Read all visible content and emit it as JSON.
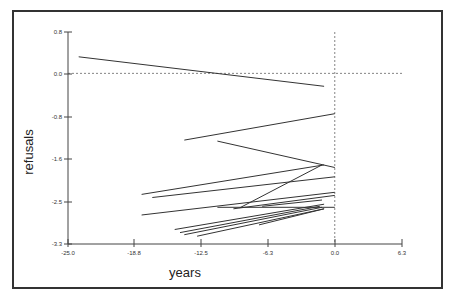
{
  "chart_data": {
    "type": "line",
    "title": "",
    "xlabel": "years",
    "ylabel": "refusals",
    "xlim": [
      -25.0,
      6.3
    ],
    "ylim": [
      -3.3,
      0.8
    ],
    "x_ticks": [
      "-25.0",
      "-18.8",
      "-12.5",
      "-6.3",
      "0.0",
      "6.3"
    ],
    "y_ticks": [
      "0.8",
      "0.0",
      "-0.8",
      "-1.6",
      "-2.5",
      "-3.3"
    ],
    "grid": false,
    "legend": null,
    "reference_lines": [
      {
        "orientation": "horizontal",
        "value": 0.0,
        "style": "dotted"
      },
      {
        "orientation": "vertical",
        "value": 0.0,
        "style": "dotted"
      }
    ],
    "series": [
      {
        "name": "case-1",
        "x": [
          -24.0,
          -1.0
        ],
        "y": [
          0.32,
          -0.25
        ]
      },
      {
        "name": "case-2",
        "x": [
          -14.1,
          0.0
        ],
        "y": [
          -1.29,
          -0.78
        ]
      },
      {
        "name": "case-3",
        "x": [
          -11.0,
          0.0
        ],
        "y": [
          -1.31,
          -1.82
        ]
      },
      {
        "name": "case-4",
        "x": [
          -18.1,
          -1.0
        ],
        "y": [
          -2.34,
          -1.77
        ]
      },
      {
        "name": "case-5",
        "x": [
          -17.1,
          0.0
        ],
        "y": [
          -2.4,
          -2.0
        ]
      },
      {
        "name": "case-6",
        "x": [
          -8.9,
          -1.2
        ],
        "y": [
          -2.6,
          -1.77
        ]
      },
      {
        "name": "case-7",
        "x": [
          -18.1,
          0.0
        ],
        "y": [
          -2.74,
          -2.3
        ]
      },
      {
        "name": "case-8",
        "x": [
          -11.0,
          0.0
        ],
        "y": [
          -2.59,
          -2.59
        ]
      },
      {
        "name": "case-9",
        "x": [
          -6.8,
          -1.2
        ],
        "y": [
          -2.57,
          -2.45
        ]
      },
      {
        "name": "case-10",
        "x": [
          -15.0,
          -1.0
        ],
        "y": [
          -3.02,
          -2.53
        ]
      },
      {
        "name": "case-11",
        "x": [
          -14.5,
          -1.4
        ],
        "y": [
          -3.08,
          -2.57
        ]
      },
      {
        "name": "case-12",
        "x": [
          -14.1,
          -1.2
        ],
        "y": [
          -3.12,
          -2.59
        ]
      },
      {
        "name": "case-13",
        "x": [
          -7.1,
          -1.0
        ],
        "y": [
          -2.93,
          -2.62
        ]
      },
      {
        "name": "case-14",
        "x": [
          -12.9,
          -1.0
        ],
        "y": [
          -3.15,
          -2.62
        ]
      },
      {
        "name": "case-15",
        "x": [
          -9.5,
          0.0
        ],
        "y": [
          -2.62,
          -2.36
        ]
      }
    ]
  },
  "axes": {
    "x_title": "years",
    "y_title": "refusals"
  },
  "colors": {
    "line": "#333333",
    "axis": "#444444",
    "frame": "#333333",
    "reference": "#666666"
  }
}
